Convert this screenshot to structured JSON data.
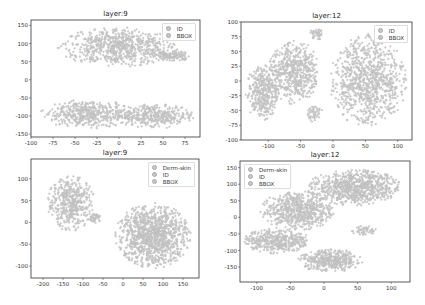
{
  "chart_data": [
    {
      "type": "scatter",
      "title": "layer:9",
      "xlabel": "",
      "ylabel": "",
      "xlim": [
        -100,
        92
      ],
      "ylim": [
        -158,
        165
      ],
      "xticks": [
        -100,
        -75,
        -50,
        -25,
        0,
        25,
        50,
        75
      ],
      "yticks": [
        -150,
        -100,
        -50,
        0,
        50,
        100,
        150
      ],
      "grid": false,
      "legend_position": "upper right",
      "legend": [
        "ID",
        "BBOX"
      ],
      "clusters": [
        {
          "cx": 0,
          "cy": 90,
          "rx": 70,
          "ry": 55,
          "n": 700
        },
        {
          "cx": 60,
          "cy": 65,
          "rx": 22,
          "ry": 15,
          "n": 120
        },
        {
          "cx": -35,
          "cy": -95,
          "rx": 55,
          "ry": 40,
          "n": 450
        },
        {
          "cx": 40,
          "cy": -100,
          "rx": 45,
          "ry": 35,
          "n": 350
        }
      ]
    },
    {
      "type": "scatter",
      "title": "layer:12",
      "xlabel": "",
      "ylabel": "",
      "xlim": [
        -142,
        122
      ],
      "ylim": [
        -100,
        100
      ],
      "xticks": [
        -100,
        -50,
        0,
        50,
        100
      ],
      "yticks": [
        -100,
        -75,
        -50,
        -25,
        0,
        25,
        50,
        75,
        100
      ],
      "grid": false,
      "legend_position": "upper right",
      "legend": [
        "ID",
        "BBOX"
      ],
      "clusters": [
        {
          "cx": -110,
          "cy": -20,
          "rx": 25,
          "ry": 48,
          "n": 350
        },
        {
          "cx": -60,
          "cy": 15,
          "rx": 40,
          "ry": 55,
          "n": 550
        },
        {
          "cx": -25,
          "cy": 80,
          "rx": 12,
          "ry": 10,
          "n": 40
        },
        {
          "cx": 55,
          "cy": 0,
          "rx": 60,
          "ry": 80,
          "n": 900
        },
        {
          "cx": -30,
          "cy": -55,
          "rx": 15,
          "ry": 15,
          "n": 50
        }
      ]
    },
    {
      "type": "scatter",
      "title": "layer:9",
      "xlabel": "",
      "ylabel": "",
      "xlim": [
        -230,
        190
      ],
      "ylim": [
        -127,
        145
      ],
      "xticks": [
        -200,
        -150,
        -100,
        -50,
        0,
        50,
        100,
        150
      ],
      "yticks": [
        -100,
        -50,
        0,
        50,
        100
      ],
      "grid": false,
      "legend_position": "upper right",
      "legend": [
        "Derm-skin",
        "ID",
        "BBOX"
      ],
      "clusters": [
        {
          "cx": -130,
          "cy": 45,
          "rx": 60,
          "ry": 65,
          "n": 450
        },
        {
          "cx": -70,
          "cy": 10,
          "rx": 15,
          "ry": 12,
          "n": 40
        },
        {
          "cx": 75,
          "cy": -30,
          "rx": 95,
          "ry": 75,
          "n": 1100
        }
      ]
    },
    {
      "type": "scatter",
      "title": "layer:12",
      "xlabel": "",
      "ylabel": "",
      "xlim": [
        -125,
        128
      ],
      "ylim": [
        -195,
        170
      ],
      "xticks": [
        -100,
        -50,
        0,
        50,
        100
      ],
      "yticks": [
        -150,
        -100,
        -50,
        0,
        50,
        100,
        150
      ],
      "grid": false,
      "legend_position": "upper left",
      "legend": [
        "Derm-skin",
        "ID",
        "BBOX"
      ],
      "clusters": [
        {
          "cx": 45,
          "cy": 90,
          "rx": 70,
          "ry": 55,
          "n": 800
        },
        {
          "cx": -40,
          "cy": 20,
          "rx": 55,
          "ry": 60,
          "n": 600
        },
        {
          "cx": -70,
          "cy": -70,
          "rx": 50,
          "ry": 40,
          "n": 400
        },
        {
          "cx": 10,
          "cy": -130,
          "rx": 50,
          "ry": 35,
          "n": 400
        },
        {
          "cx": 60,
          "cy": -40,
          "rx": 20,
          "ry": 15,
          "n": 50
        }
      ]
    }
  ],
  "style": {
    "marker_fill": "#cfcfcf",
    "marker_edge": "#a9a9a9",
    "frame_color": "#333333",
    "legend_colors": [
      "#c8c8c8",
      "#c8c8c8",
      "#c8c8c8"
    ]
  },
  "panels": [
    {
      "title": "layer:9",
      "legend": [
        "ID",
        "BBOX"
      ]
    },
    {
      "title": "layer:12",
      "legend": [
        "ID",
        "BBOX"
      ]
    },
    {
      "title": "layer:9",
      "legend": [
        "Derm-skin",
        "ID",
        "BBOX"
      ]
    },
    {
      "title": "layer:12",
      "legend": [
        "Derm-skin",
        "ID",
        "BBOX"
      ]
    }
  ]
}
